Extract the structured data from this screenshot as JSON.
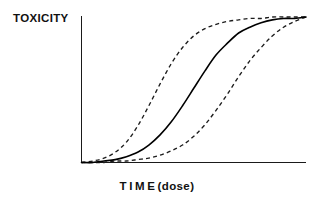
{
  "chart_data": {
    "type": "line",
    "title": "",
    "xlabel": "TIME (dose)",
    "ylabel": "TOXICITY",
    "xlabel_parts": {
      "main": "TIME",
      "sub": "(dose)"
    },
    "grid": false,
    "legend": "none",
    "axis_ticks": {
      "x": [],
      "y": []
    },
    "xlim": [
      0,
      100
    ],
    "ylim": [
      0,
      100
    ],
    "x": [
      0,
      5,
      10,
      15,
      20,
      25,
      30,
      35,
      40,
      45,
      50,
      55,
      60,
      65,
      70,
      75,
      80,
      85,
      90,
      95,
      100
    ],
    "series": [
      {
        "name": "fast onset (lower threshold)",
        "style": "dashed",
        "color": "#1c1c1c",
        "values": [
          0,
          1,
          3,
          7,
          14,
          25,
          39,
          54,
          68,
          79,
          87,
          92,
          95,
          97,
          98,
          99,
          99,
          100,
          100,
          100,
          100
        ]
      },
      {
        "name": "typical response",
        "style": "solid",
        "color": "#000000",
        "values": [
          0,
          0,
          1,
          2,
          4,
          7,
          12,
          19,
          28,
          39,
          51,
          63,
          74,
          82,
          89,
          93,
          96,
          98,
          99,
          99,
          100
        ]
      },
      {
        "name": "slow onset (higher threshold)",
        "style": "dashed",
        "color": "#1c1c1c",
        "values": [
          0,
          0,
          0,
          1,
          1,
          2,
          3,
          5,
          8,
          12,
          18,
          26,
          36,
          47,
          59,
          70,
          79,
          87,
          93,
          97,
          100
        ]
      }
    ],
    "annotations": []
  },
  "figure": {
    "background_color": "#ffffff",
    "axis_color": "#1a1a1a",
    "label_color": "#111111"
  }
}
